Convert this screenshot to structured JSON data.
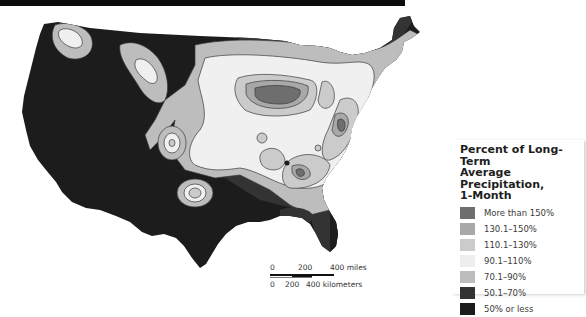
{
  "legend": {
    "title": "Percent of Long-Term Average Precipitation, 1-Month",
    "title_lines": [
      "Percent of Long-Term",
      "Average Precipitation,",
      "1-Month"
    ],
    "items": [
      {
        "label": "More than 150%",
        "color": "#6e6e6e"
      },
      {
        "label": "130.1–150%",
        "color": "#a8a8a8"
      },
      {
        "label": "110.1–130%",
        "color": "#cbcbcb"
      },
      {
        "label": "90.1–110%",
        "color": "#eeeeee"
      },
      {
        "label": "70.1–90%",
        "color": "#bdbdbd"
      },
      {
        "label": "50.1–70%",
        "color": "#333333"
      },
      {
        "label": "50% or less",
        "color": "#1c1c1c"
      }
    ]
  },
  "scale_bar": {
    "miles": {
      "labels": [
        "0",
        "200",
        "400 miles"
      ]
    },
    "kilometers": {
      "labels": [
        "0",
        "200",
        "400 kilometers"
      ]
    }
  },
  "colors": {
    "more_than_150": "#6e6e6e",
    "c130_150": "#a8a8a8",
    "c110_130": "#cbcbcb",
    "c90_110": "#f0f0f0",
    "c70_90": "#bdbdbd",
    "c50_70": "#333333",
    "c50_or_less": "#1c1c1c",
    "contour": "#3a3a3a"
  }
}
